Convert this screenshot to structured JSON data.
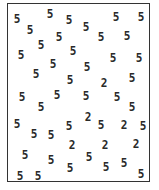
{
  "task": {
    "type": "visual-search",
    "distractor": "5",
    "target": "2"
  },
  "colors": {
    "background": "#ffffff",
    "border": "#333333",
    "glyph": "#2a2a2a"
  },
  "frame": {
    "x": 7,
    "y": 3,
    "width": 143,
    "height": 179
  },
  "glyphs": [
    {
      "char": "5",
      "x": 17,
      "y": 19
    },
    {
      "char": "5",
      "x": 50,
      "y": 14
    },
    {
      "char": "5",
      "x": 69,
      "y": 20
    },
    {
      "char": "5",
      "x": 116,
      "y": 17
    },
    {
      "char": "5",
      "x": 141,
      "y": 17
    },
    {
      "char": "5",
      "x": 30,
      "y": 30
    },
    {
      "char": "5",
      "x": 86,
      "y": 27
    },
    {
      "char": "5",
      "x": 59,
      "y": 37
    },
    {
      "char": "5",
      "x": 101,
      "y": 37
    },
    {
      "char": "5",
      "x": 127,
      "y": 36
    },
    {
      "char": "5",
      "x": 41,
      "y": 45
    },
    {
      "char": "5",
      "x": 21,
      "y": 55
    },
    {
      "char": "5",
      "x": 73,
      "y": 51
    },
    {
      "char": "5",
      "x": 113,
      "y": 58
    },
    {
      "char": "5",
      "x": 139,
      "y": 58
    },
    {
      "char": "5",
      "x": 53,
      "y": 64
    },
    {
      "char": "5",
      "x": 87,
      "y": 67
    },
    {
      "char": "5",
      "x": 36,
      "y": 74
    },
    {
      "char": "5",
      "x": 70,
      "y": 80
    },
    {
      "char": "2",
      "x": 104,
      "y": 83
    },
    {
      "char": "5",
      "x": 132,
      "y": 78
    },
    {
      "char": "5",
      "x": 22,
      "y": 97
    },
    {
      "char": "5",
      "x": 57,
      "y": 95
    },
    {
      "char": "5",
      "x": 86,
      "y": 96
    },
    {
      "char": "5",
      "x": 117,
      "y": 97
    },
    {
      "char": "5",
      "x": 41,
      "y": 107
    },
    {
      "char": "5",
      "x": 132,
      "y": 107
    },
    {
      "char": "5",
      "x": 17,
      "y": 124
    },
    {
      "char": "5",
      "x": 34,
      "y": 134
    },
    {
      "char": "5",
      "x": 51,
      "y": 135
    },
    {
      "char": "5",
      "x": 69,
      "y": 126
    },
    {
      "char": "2",
      "x": 88,
      "y": 117
    },
    {
      "char": "5",
      "x": 101,
      "y": 125
    },
    {
      "char": "2",
      "x": 124,
      "y": 125
    },
    {
      "char": "5",
      "x": 143,
      "y": 126
    },
    {
      "char": "2",
      "x": 72,
      "y": 145
    },
    {
      "char": "2",
      "x": 105,
      "y": 145
    },
    {
      "char": "2",
      "x": 136,
      "y": 144
    },
    {
      "char": "5",
      "x": 25,
      "y": 155
    },
    {
      "char": "5",
      "x": 51,
      "y": 160
    },
    {
      "char": "5",
      "x": 89,
      "y": 157
    },
    {
      "char": "5",
      "x": 70,
      "y": 168
    },
    {
      "char": "5",
      "x": 106,
      "y": 167
    },
    {
      "char": "5",
      "x": 124,
      "y": 163
    },
    {
      "char": "5",
      "x": 20,
      "y": 176
    },
    {
      "char": "5",
      "x": 38,
      "y": 176
    },
    {
      "char": "5",
      "x": 141,
      "y": 174
    }
  ]
}
